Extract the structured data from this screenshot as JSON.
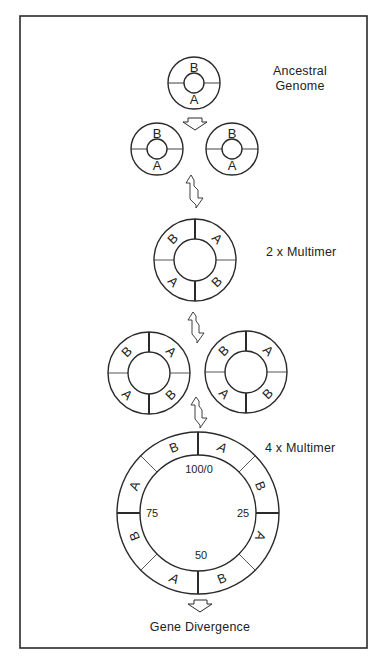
{
  "figure": {
    "frame": {
      "x": 20,
      "y": 16,
      "width": 347,
      "height": 632
    },
    "stroke_color": "#2a2a2a",
    "background": "#ffffff"
  },
  "labels": {
    "ancestral_line1": "Ancestral",
    "ancestral_line2": "Genome",
    "multimer_2x": "2 x Multimer",
    "multimer_4x": "4 x Multimer",
    "gene_divergence": "Gene Divergence"
  },
  "stages": [
    {
      "name": "ancestral-genome",
      "segments": [
        "B",
        "A"
      ]
    },
    {
      "name": "duplicated-genomes",
      "count": 2,
      "segments": [
        "B",
        "A"
      ]
    },
    {
      "name": "2x-multimer",
      "segments": [
        "A",
        "B",
        "A",
        "B"
      ]
    },
    {
      "name": "2x-multimer-pair",
      "count": 2,
      "segments": [
        "A",
        "B",
        "A",
        "B"
      ]
    },
    {
      "name": "4x-multimer",
      "segments": [
        "A",
        "B",
        "A",
        "B",
        "A",
        "B",
        "A",
        "B"
      ],
      "map_positions": [
        "100/0",
        "25",
        "50",
        "75"
      ]
    }
  ],
  "map_positions": {
    "top": "100/0",
    "right": "25",
    "bottom": "50",
    "left": "75"
  },
  "segment_letters": {
    "a": "A",
    "b": "B"
  }
}
